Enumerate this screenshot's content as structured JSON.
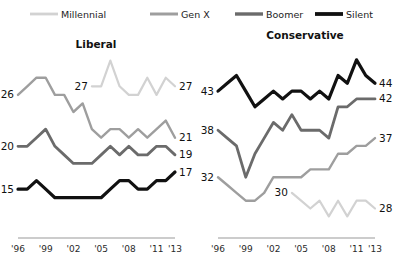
{
  "legend": {
    "position": "top",
    "items": [
      {
        "label": "Millennial",
        "color": "#d2d2d2",
        "width": 2.2
      },
      {
        "label": "Gen X",
        "color": "#9e9e9e",
        "width": 2.4
      },
      {
        "label": "Boomer",
        "color": "#6b6b6b",
        "width": 2.8
      },
      {
        "label": "Silent",
        "color": "#111111",
        "width": 3.2
      }
    ]
  },
  "chart_data": [
    {
      "type": "line",
      "title": "Liberal",
      "xlabel": "",
      "ylabel": "",
      "grid": false,
      "xlim": [
        1996,
        2013
      ],
      "ylim": [
        10,
        31
      ],
      "tick_labels": [
        "'96",
        "'99",
        "'02",
        "'05",
        "'08",
        "'11",
        "'13"
      ],
      "tick_years": [
        1996,
        1999,
        2002,
        2005,
        2008,
        2011,
        2013
      ],
      "series": [
        {
          "name": "Millennial",
          "color": "#d2d2d2",
          "width": 2.2,
          "start_label": "27",
          "end_label": "27",
          "x": [
            2004,
            2005,
            2006,
            2007,
            2008,
            2009,
            2010,
            2011,
            2012,
            2013
          ],
          "values": [
            27,
            27,
            30,
            27,
            26,
            26,
            28,
            26,
            28,
            27
          ]
        },
        {
          "name": "Gen X",
          "color": "#9e9e9e",
          "width": 2.4,
          "start_label": "26",
          "end_label": "21",
          "x": [
            1996,
            1997,
            1998,
            1999,
            2000,
            2001,
            2002,
            2003,
            2004,
            2005,
            2006,
            2007,
            2008,
            2009,
            2010,
            2011,
            2012,
            2013
          ],
          "values": [
            26,
            27,
            28,
            28,
            26,
            26,
            24,
            25,
            22,
            21,
            22,
            22,
            21,
            22,
            21,
            22,
            23,
            21
          ]
        },
        {
          "name": "Boomer",
          "color": "#6b6b6b",
          "width": 2.8,
          "start_label": "20",
          "end_label": "19",
          "x": [
            1996,
            1997,
            1998,
            1999,
            2000,
            2001,
            2002,
            2003,
            2004,
            2005,
            2006,
            2007,
            2008,
            2009,
            2010,
            2011,
            2012,
            2013
          ],
          "values": [
            20,
            20,
            21,
            22,
            20,
            19,
            18,
            18,
            18,
            19,
            20,
            19,
            20,
            19,
            19,
            20,
            20,
            19
          ]
        },
        {
          "name": "Silent",
          "color": "#111111",
          "width": 3.2,
          "start_label": "15",
          "end_label": "17",
          "x": [
            1996,
            1997,
            1998,
            1999,
            2000,
            2001,
            2002,
            2003,
            2004,
            2005,
            2006,
            2007,
            2008,
            2009,
            2010,
            2011,
            2012,
            2013
          ],
          "values": [
            15,
            15,
            16,
            15,
            14,
            14,
            14,
            14,
            14,
            14,
            15,
            16,
            16,
            15,
            15,
            16,
            16,
            17
          ]
        }
      ]
    },
    {
      "type": "line",
      "title": "Conservative",
      "xlabel": "",
      "ylabel": "",
      "grid": false,
      "xlim": [
        1996,
        2013
      ],
      "ylim": [
        25,
        48
      ],
      "tick_labels": [
        "'96",
        "'99",
        "'02",
        "'05",
        "'08",
        "'11",
        "'13"
      ],
      "tick_years": [
        1996,
        1999,
        2002,
        2005,
        2008,
        2011,
        2013
      ],
      "series": [
        {
          "name": "Millennial",
          "color": "#d2d2d2",
          "width": 2.2,
          "start_label": "30",
          "end_label": "28",
          "x": [
            2004,
            2005,
            2006,
            2007,
            2008,
            2009,
            2010,
            2011,
            2012,
            2013
          ],
          "values": [
            30,
            29,
            28,
            29,
            27,
            29,
            27,
            29,
            29,
            28
          ]
        },
        {
          "name": "Gen X",
          "color": "#9e9e9e",
          "width": 2.4,
          "start_label": "32",
          "end_label": "37",
          "x": [
            1996,
            1997,
            1998,
            1999,
            2000,
            2001,
            2002,
            2003,
            2004,
            2005,
            2006,
            2007,
            2008,
            2009,
            2010,
            2011,
            2012,
            2013
          ],
          "values": [
            32,
            31,
            30,
            29,
            29,
            30,
            32,
            32,
            32,
            32,
            33,
            33,
            33,
            35,
            35,
            36,
            36,
            37
          ]
        },
        {
          "name": "Boomer",
          "color": "#6b6b6b",
          "width": 2.8,
          "start_label": "38",
          "end_label": "42",
          "x": [
            1996,
            1997,
            1998,
            1999,
            2000,
            2001,
            2002,
            2003,
            2004,
            2005,
            2006,
            2007,
            2008,
            2009,
            2010,
            2011,
            2012,
            2013
          ],
          "values": [
            38,
            37,
            36,
            32,
            35,
            37,
            39,
            38,
            40,
            38,
            38,
            38,
            37,
            41,
            41,
            42,
            42,
            42
          ]
        },
        {
          "name": "Silent",
          "color": "#111111",
          "width": 3.2,
          "start_label": "43",
          "end_label": "44",
          "x": [
            1996,
            1997,
            1998,
            1999,
            2000,
            2001,
            2002,
            2003,
            2004,
            2005,
            2006,
            2007,
            2008,
            2009,
            2010,
            2011,
            2012,
            2013
          ],
          "values": [
            43,
            44,
            45,
            43,
            41,
            42,
            43,
            42,
            43,
            43,
            42,
            43,
            42,
            45,
            44,
            47,
            45,
            44
          ]
        }
      ]
    }
  ]
}
